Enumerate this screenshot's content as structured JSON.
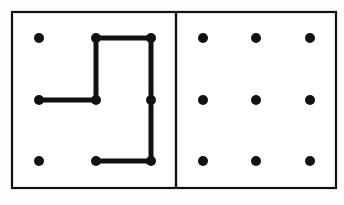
{
  "figure": {
    "canvas": {
      "width": 344,
      "height": 205
    },
    "background_color": "#fdfdfc",
    "ink_color": "#111111",
    "frame": {
      "name": "outer-frame",
      "x": 12,
      "y": 12,
      "width": 324,
      "height": 176,
      "stroke_width": 2.2,
      "stroke_color": "#111111",
      "fill_color": "#ffffff"
    },
    "divider": {
      "name": "panel-divider",
      "x": 176,
      "y_top": 12,
      "y_bottom": 188,
      "stroke_width": 2.4,
      "stroke_color": "#111111"
    },
    "dot": {
      "radius": 5.0,
      "color": "#111111"
    },
    "path": {
      "stroke_width": 5.0,
      "stroke_color": "#111111",
      "linecap": "round",
      "linejoin": "round"
    },
    "panels": [
      {
        "name": "left-panel",
        "label": "stimulus-panel",
        "has_pattern": true,
        "grid": {
          "columns": 3,
          "rows": 3,
          "xs": [
            39,
            96,
            151
          ],
          "ys": [
            38,
            100,
            161
          ]
        },
        "dots": [
          {
            "id": "L-r0c0",
            "cx": 39,
            "cy": 38,
            "on_path": false
          },
          {
            "id": "L-r0c1",
            "cx": 96,
            "cy": 38,
            "on_path": true
          },
          {
            "id": "L-r0c2",
            "cx": 151,
            "cy": 38,
            "on_path": true
          },
          {
            "id": "L-r1c0",
            "cx": 39,
            "cy": 100,
            "on_path": true
          },
          {
            "id": "L-r1c1",
            "cx": 96,
            "cy": 100,
            "on_path": true
          },
          {
            "id": "L-r1c2",
            "cx": 151,
            "cy": 100,
            "on_path": true
          },
          {
            "id": "L-r2c0",
            "cx": 39,
            "cy": 161,
            "on_path": false
          },
          {
            "id": "L-r2c1",
            "cx": 96,
            "cy": 161,
            "on_path": true
          },
          {
            "id": "L-r2c2",
            "cx": 151,
            "cy": 161,
            "on_path": true
          }
        ],
        "segments": [
          {
            "id": "seg-top-horizontal",
            "x1": 96,
            "y1": 38,
            "x2": 151,
            "y2": 38
          },
          {
            "id": "seg-left-vertical",
            "x1": 96,
            "y1": 38,
            "x2": 96,
            "y2": 100
          },
          {
            "id": "seg-middle-horizontal",
            "x1": 96,
            "y1": 100,
            "x2": 39,
            "y2": 100
          },
          {
            "id": "seg-right-vertical",
            "x1": 151,
            "y1": 38,
            "x2": 151,
            "y2": 161
          },
          {
            "id": "seg-bottom-horizontal",
            "x1": 151,
            "y1": 161,
            "x2": 96,
            "y2": 161
          }
        ],
        "polyline_points": "39,100 96,100 96,38 151,38 151,161 96,161"
      },
      {
        "name": "right-panel",
        "label": "response-panel",
        "has_pattern": false,
        "grid": {
          "columns": 3,
          "rows": 3,
          "xs": [
            203,
            256,
            310
          ],
          "ys": [
            38,
            100,
            161
          ]
        },
        "dots": [
          {
            "id": "R-r0c0",
            "cx": 203,
            "cy": 38,
            "on_path": false
          },
          {
            "id": "R-r0c1",
            "cx": 256,
            "cy": 38,
            "on_path": false
          },
          {
            "id": "R-r0c2",
            "cx": 310,
            "cy": 38,
            "on_path": false
          },
          {
            "id": "R-r1c0",
            "cx": 203,
            "cy": 100,
            "on_path": false
          },
          {
            "id": "R-r1c1",
            "cx": 256,
            "cy": 100,
            "on_path": false
          },
          {
            "id": "R-r1c2",
            "cx": 310,
            "cy": 100,
            "on_path": false
          },
          {
            "id": "R-r2c0",
            "cx": 203,
            "cy": 161,
            "on_path": false
          },
          {
            "id": "R-r2c1",
            "cx": 256,
            "cy": 161,
            "on_path": false
          },
          {
            "id": "R-r2c2",
            "cx": 310,
            "cy": 161,
            "on_path": false
          }
        ],
        "segments": [],
        "polyline_points": ""
      }
    ]
  }
}
